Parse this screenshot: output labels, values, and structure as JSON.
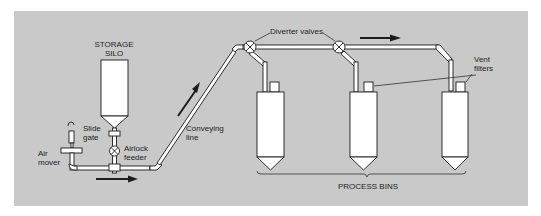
{
  "diagram": {
    "type": "pneumatic conveying system schematic",
    "background_color": "#c9c9c9",
    "line_color": "#1c1c1c",
    "component_fill": "#ffffff",
    "labels": {
      "storage_silo": "STORAGE\nSILO",
      "slide_gate": "Slide\ngate",
      "airlock_feeder": "Airlock\nfeeder",
      "air_mover": "Air\nmover",
      "conveying_line": "Conveying\nline",
      "diverter_valves": "Diverter valves",
      "vent_filters": "Vent\nfilters",
      "process_bins": "PROCESS BINS"
    },
    "components": [
      {
        "id": "storage-silo",
        "label": "STORAGE SILO"
      },
      {
        "id": "slide-gate",
        "label": "Slide gate"
      },
      {
        "id": "airlock-feeder",
        "label": "Airlock feeder"
      },
      {
        "id": "air-mover",
        "label": "Air mover"
      },
      {
        "id": "conveying-line",
        "label": "Conveying line"
      },
      {
        "id": "diverter-valve-1",
        "label": "Diverter valves"
      },
      {
        "id": "diverter-valve-2",
        "label": "Diverter valves"
      },
      {
        "id": "process-bin-1",
        "label": "PROCESS BINS"
      },
      {
        "id": "process-bin-2",
        "label": "PROCESS BINS"
      },
      {
        "id": "process-bin-3",
        "label": "PROCESS BINS"
      },
      {
        "id": "vent-filter-2",
        "label": "Vent filters"
      },
      {
        "id": "vent-filter-3",
        "label": "Vent filters"
      }
    ],
    "flow_arrows": [
      "horizontal-right-bottom",
      "diagonal-up-right",
      "horizontal-right-top"
    ]
  }
}
